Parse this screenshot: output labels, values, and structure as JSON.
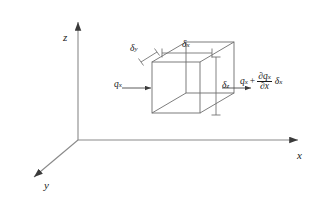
{
  "figure": {
    "type": "engineering-diagram",
    "background_color": "#ffffff",
    "line_color": "#4a4a4a",
    "text_color": "#1a1a1a"
  },
  "axes": {
    "origin": {
      "x": 78,
      "y": 140
    },
    "items": [
      {
        "id": "z",
        "label": "z",
        "direction": "up",
        "label_x": 63,
        "label_y": 32
      },
      {
        "id": "x",
        "label": "x",
        "direction": "right",
        "label_x": 297,
        "label_y": 150
      },
      {
        "id": "y",
        "label": "y",
        "direction": "down-left",
        "label_x": 44,
        "label_y": 180
      }
    ]
  },
  "control_volume": {
    "name": "cube",
    "front_face": {
      "left": 152,
      "top": 62,
      "right": 200,
      "bottom": 113
    },
    "depth_offset": {
      "dx": 34,
      "dy": -20
    }
  },
  "dimensions": [
    {
      "id": "delta-x",
      "symbol": "δ",
      "subscript": "x",
      "label_x": 182,
      "label_y": 40,
      "line": {
        "x1": 162,
        "y1": 53,
        "x2": 212,
        "y2": 53
      },
      "orientation": "horizontal"
    },
    {
      "id": "delta-y",
      "symbol": "δ",
      "subscript": "y",
      "label_x": 130,
      "label_y": 44,
      "line": {
        "x1": 141,
        "y1": 62,
        "x2": 157,
        "y2": 52
      },
      "orientation": "diagonal"
    },
    {
      "id": "delta-z",
      "symbol": "δ",
      "subscript": "z",
      "label_x": 222,
      "label_y": 81,
      "line": {
        "x1": 216,
        "y1": 57,
        "x2": 216,
        "y2": 115
      },
      "orientation": "vertical"
    }
  ],
  "heat_flux": {
    "inflow": {
      "id": "q-x-in",
      "symbol": "q",
      "subscript": "x",
      "label_x": 114,
      "label_y": 80,
      "arrow": {
        "x1": 122,
        "y1": 88,
        "x2": 150,
        "y2": 88
      }
    },
    "outflow": {
      "id": "q-x-out",
      "base_symbol": "q",
      "base_subscript": "x",
      "operator": "+",
      "numerator_symbol": "∂q",
      "numerator_subscript": "x",
      "denominator": "∂x",
      "trailing_symbol": "δ",
      "trailing_subscript": "x",
      "label_x": 240,
      "label_y": 72,
      "arrow": {
        "x1": 222,
        "y1": 88,
        "x2": 250,
        "y2": 88
      }
    }
  }
}
